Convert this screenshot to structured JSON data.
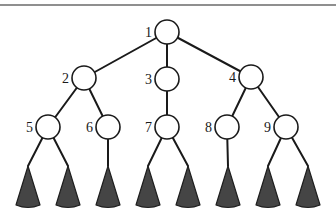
{
  "diagram": {
    "type": "tree",
    "colors": {
      "edge": "#1a1a1a",
      "node_fill": "#ffffff",
      "node_stroke": "#1a1a1a",
      "subtree_fill": "#454545",
      "top_rule": "#6a6a6a"
    },
    "nodes": [
      {
        "id": "1",
        "label": "1",
        "x": 167,
        "y": 32
      },
      {
        "id": "2",
        "label": "2",
        "x": 84,
        "y": 78
      },
      {
        "id": "3",
        "label": "3",
        "x": 167,
        "y": 79
      },
      {
        "id": "4",
        "label": "4",
        "x": 251,
        "y": 77
      },
      {
        "id": "5",
        "label": "5",
        "x": 48,
        "y": 127
      },
      {
        "id": "6",
        "label": "6",
        "x": 108,
        "y": 127
      },
      {
        "id": "7",
        "label": "7",
        "x": 167,
        "y": 127
      },
      {
        "id": "8",
        "label": "8",
        "x": 227,
        "y": 127
      },
      {
        "id": "9",
        "label": "9",
        "x": 286,
        "y": 127
      }
    ],
    "edges": [
      [
        "1",
        "2"
      ],
      [
        "1",
        "3"
      ],
      [
        "1",
        "4"
      ],
      [
        "2",
        "5"
      ],
      [
        "2",
        "6"
      ],
      [
        "3",
        "7"
      ],
      [
        "4",
        "8"
      ],
      [
        "4",
        "9"
      ]
    ],
    "subtrees": [
      {
        "parent": "5",
        "apex_x": 28
      },
      {
        "parent": "5",
        "apex_x": 68
      },
      {
        "parent": "6",
        "apex_x": 108
      },
      {
        "parent": "7",
        "apex_x": 148
      },
      {
        "parent": "7",
        "apex_x": 188
      },
      {
        "parent": "8",
        "apex_x": 228
      },
      {
        "parent": "9",
        "apex_x": 268
      },
      {
        "parent": "9",
        "apex_x": 308
      }
    ]
  }
}
